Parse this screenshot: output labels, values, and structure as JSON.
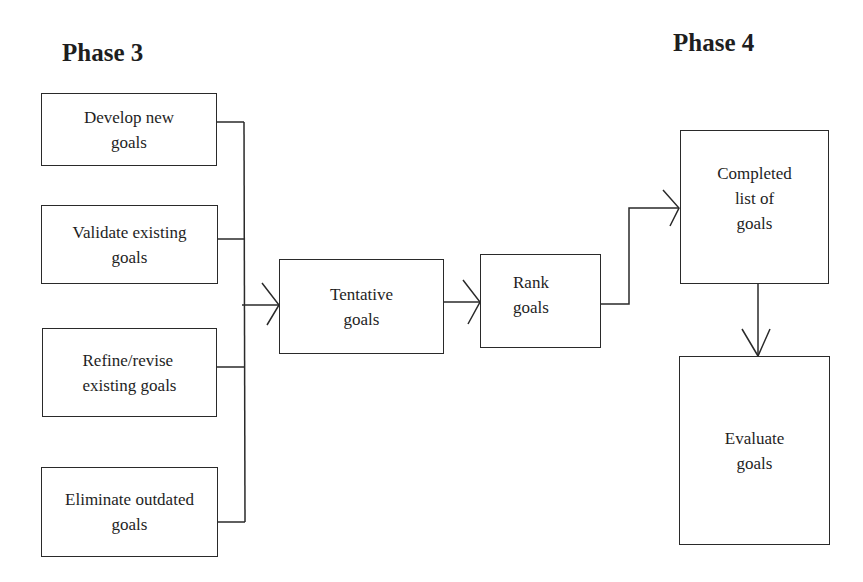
{
  "phases": {
    "left": "Phase 3",
    "right": "Phase 4"
  },
  "boxes": {
    "develop": "Develop new\ngoals",
    "validate": "Validate existing\ngoals",
    "refine": "Refine/revise\nexisting goals",
    "eliminate": "Eliminate outdated\ngoals",
    "tentative": "Tentative\ngoals",
    "rank": "Rank\ngoals",
    "completed": "Completed\nlist of\ngoals",
    "evaluate": "Evaluate\ngoals"
  },
  "colors": {
    "line": "#2a2a2a",
    "background": "#ffffff",
    "text": "#1e1e1e"
  }
}
